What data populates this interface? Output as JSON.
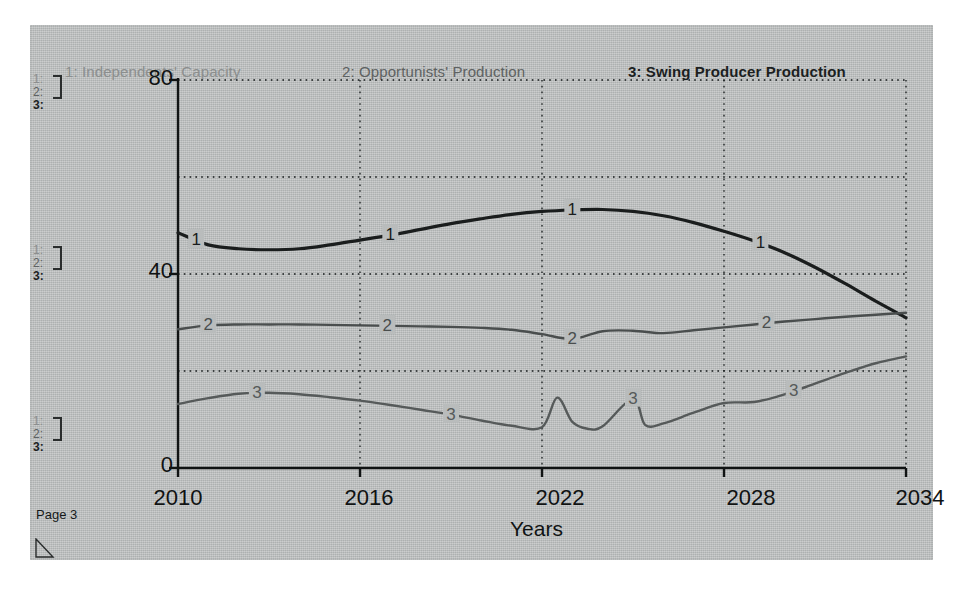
{
  "window": {
    "page_label": "Page 3"
  },
  "legend": {
    "items": [
      {
        "label": "1: Independents' Capacity",
        "color": "#8b8e8e"
      },
      {
        "label": "2: Opportunists' Production",
        "color": "#5e6262"
      },
      {
        "label": "3: Swing Producer Production",
        "color": "#1c1f1f"
      }
    ]
  },
  "scale_markers": {
    "rows": [
      "1:",
      "2:",
      "3:"
    ],
    "groups": [
      "top",
      "middle",
      "bottom"
    ]
  },
  "chart_data": {
    "type": "line",
    "title": "",
    "xlabel": "Years",
    "ylabel": "",
    "xlim": [
      2010,
      2034
    ],
    "ylim": [
      0,
      80
    ],
    "xticks": [
      "2010",
      "2016",
      "2022",
      "2028",
      "2034"
    ],
    "yticks": [
      "0",
      "40",
      "80"
    ],
    "grid": true,
    "legend_position": "top",
    "series": [
      {
        "name": "1: Independents' Capacity",
        "key": "1",
        "color": "#1a1d1d",
        "width": 3.2,
        "label_points": [
          2010.6,
          2017.0,
          2023.0,
          2029.2
        ],
        "x": [
          2010,
          2011,
          2012,
          2013,
          2014,
          2015,
          2016,
          2017,
          2018,
          2019,
          2020,
          2021,
          2022,
          2023,
          2024,
          2025,
          2026,
          2027,
          2028,
          2029,
          2030,
          2031,
          2032,
          2033,
          2034
        ],
        "y": [
          48.5,
          46.0,
          45.2,
          45.0,
          45.2,
          46.0,
          47.0,
          48.0,
          49.2,
          50.4,
          51.4,
          52.3,
          52.9,
          53.2,
          53.3,
          52.9,
          52.0,
          50.6,
          48.8,
          46.8,
          44.4,
          41.4,
          38.0,
          34.4,
          31.0
        ]
      },
      {
        "name": "2: Opportunists' Production",
        "key": "2",
        "color": "#4a4e4e",
        "width": 2.4,
        "label_points": [
          2011.0,
          2016.9,
          2023.0,
          2029.4
        ],
        "x": [
          2010,
          2011,
          2012,
          2013,
          2014,
          2015,
          2016,
          2017,
          2018,
          2019,
          2020,
          2021,
          2022,
          2023,
          2024,
          2025,
          2026,
          2027,
          2028,
          2029,
          2030,
          2031,
          2032,
          2033,
          2034
        ],
        "y": [
          28.6,
          29.4,
          29.6,
          29.6,
          29.6,
          29.5,
          29.4,
          29.3,
          29.2,
          29.1,
          28.9,
          28.5,
          27.6,
          26.6,
          28.2,
          28.3,
          27.8,
          28.4,
          29.0,
          29.6,
          30.2,
          30.7,
          31.2,
          31.6,
          32.0
        ]
      },
      {
        "name": "3: Swing Producer Production",
        "key": "3",
        "color": "#565a5a",
        "width": 2.4,
        "label_points": [
          2012.6,
          2019.0,
          2025.0,
          2030.3
        ],
        "x": [
          2010,
          2011,
          2012,
          2013,
          2014,
          2015,
          2016,
          2017,
          2018,
          2019,
          2020,
          2021,
          2022,
          2022.5,
          2023,
          2023.5,
          2024,
          2025,
          2025.4,
          2026,
          2027,
          2028,
          2029,
          2030,
          2031,
          2032,
          2033,
          2034
        ],
        "y": [
          13.2,
          14.4,
          15.3,
          15.5,
          15.2,
          14.6,
          13.9,
          13.0,
          12.0,
          11.0,
          9.8,
          8.7,
          8.4,
          14.5,
          9.5,
          8.1,
          8.6,
          14.3,
          8.9,
          9.2,
          11.4,
          13.4,
          13.6,
          15.2,
          17.4,
          19.6,
          21.6,
          23.0
        ]
      }
    ]
  }
}
